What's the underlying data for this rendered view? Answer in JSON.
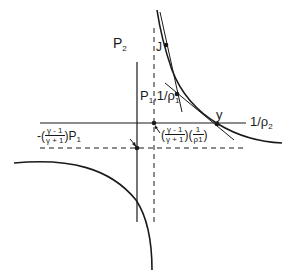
{
  "diagram": {
    "type": "hugoniot-rayleigh-plot",
    "axes": {
      "vertical_label": "P",
      "vertical_label_sub": "2",
      "horizontal_label": "1/ρ",
      "horizontal_label_sub": "2"
    },
    "points": {
      "J": "J",
      "initial": {
        "main": "P",
        "sub1": "1",
        "mid": ",1/ρ",
        "sub2": "1"
      },
      "y": "y"
    },
    "asymptotes": {
      "horizontal": {
        "prefix": "-(",
        "num": "γ - 1",
        "den": "γ + 1",
        "suffix": ")P",
        "sub": "1"
      },
      "vertical": {
        "open": "(",
        "num": "γ - 1",
        "den": "γ + 1",
        "mid": ")(",
        "num2": "1",
        "den2": "ρ1",
        "close": ")"
      }
    },
    "colors": {
      "line": "#1a1a1a",
      "background": "#ffffff"
    }
  }
}
